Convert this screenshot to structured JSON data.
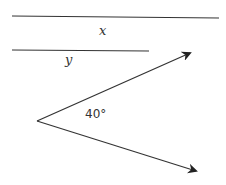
{
  "diagram": {
    "stroke_color": "#333333",
    "lines": [
      {
        "name": "line-x",
        "label": "x",
        "x1": 12,
        "y1": 16,
        "x2": 219,
        "y2": 18
      },
      {
        "name": "line-y",
        "label": "y",
        "x1": 12,
        "y1": 50,
        "x2": 149,
        "y2": 51
      }
    ],
    "angle": {
      "vertex": [
        37,
        121
      ],
      "ray_upper_tip": [
        190,
        53
      ],
      "ray_lower_tip": [
        196,
        171
      ],
      "label": "40°"
    },
    "labels": {
      "x": "x",
      "y": "y",
      "angle": "40°"
    }
  }
}
